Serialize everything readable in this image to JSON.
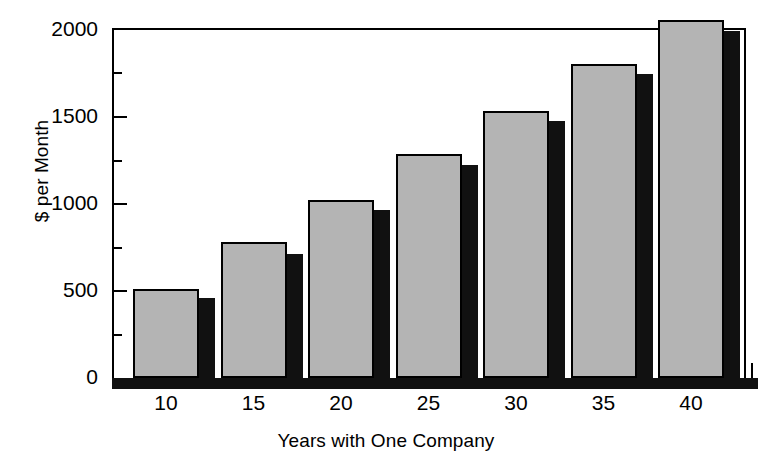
{
  "chart_data": {
    "type": "bar",
    "title": "",
    "xlabel": "Years with One Company",
    "ylabel": "$ per Month",
    "categories": [
      "10",
      "15",
      "20",
      "25",
      "30",
      "35",
      "40"
    ],
    "x": [
      10,
      15,
      20,
      25,
      30,
      35,
      40
    ],
    "xlim": [
      7.5,
      43.5
    ],
    "ylim": [
      0,
      2000
    ],
    "yticks": [
      0,
      500,
      1000,
      1500,
      2000
    ],
    "ytick_labels": [
      "0",
      "500",
      "1000",
      "1500",
      "2000"
    ],
    "yticks_minor": [
      250,
      750,
      1250,
      1750
    ],
    "grid": false,
    "legend": "none",
    "series": [
      {
        "name": "front-bar",
        "color": "#b4b4b4",
        "values": [
          510,
          775,
          1020,
          1280,
          1525,
          1795,
          2045
        ]
      },
      {
        "name": "back-bar",
        "color": "#111111",
        "values": [
          455,
          710,
          960,
          1215,
          1470,
          1735,
          1985
        ]
      }
    ]
  },
  "axes": {
    "y_title": "$ per Month",
    "x_title": "Years with One Company",
    "y_tick_labels": [
      "2000",
      "1500",
      "1000",
      "500",
      "0"
    ],
    "x_tick_labels": [
      "10",
      "15",
      "20",
      "25",
      "30",
      "35",
      "40"
    ]
  },
  "colors": {
    "bar_primary": "#b4b4b4",
    "bar_secondary": "#111111",
    "axis": "#000000",
    "background": "#ffffff"
  }
}
